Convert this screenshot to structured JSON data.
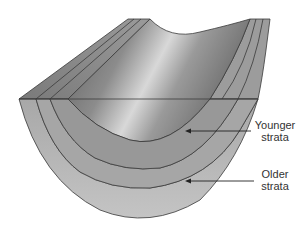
{
  "diagram": {
    "labels": {
      "younger": {
        "line1": "Younger",
        "line2": "strata"
      },
      "older": {
        "line1": "Older",
        "line2": "strata"
      }
    },
    "colors": {
      "outline": "#3a3a3a",
      "outer_layer": "#b4b4b4",
      "middle_layer": "#a2a2a2",
      "inner_layer": "#939393",
      "core_dark": "#6e6e6e",
      "core_light": "#d2d2d2",
      "top_edge": "#8a8a8a",
      "arrow": "#222222"
    }
  }
}
